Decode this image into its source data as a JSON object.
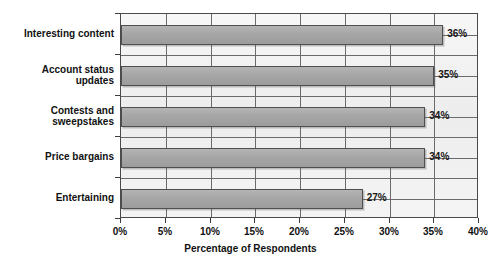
{
  "chart_data": {
    "type": "bar",
    "orientation": "horizontal",
    "title": "",
    "xlabel": "Percentage of Respondents",
    "ylabel": "",
    "categories": [
      "Interesting content",
      "Account status\nupdates",
      "Contests and\nsweepstakes",
      "Price bargains",
      "Entertaining"
    ],
    "values": [
      36,
      35,
      34,
      34,
      27
    ],
    "value_labels": [
      "36%",
      "35%",
      "34%",
      "34%",
      "27%"
    ],
    "xlim": [
      0,
      40
    ],
    "xticks": [
      0,
      5,
      10,
      15,
      20,
      25,
      30,
      35,
      40
    ],
    "xtick_labels": [
      "0%",
      "5%",
      "10%",
      "15%",
      "20%",
      "25%",
      "30%",
      "35%",
      "40%"
    ],
    "grid": true,
    "grid_axis": "both",
    "legend": null,
    "colors": {
      "bar_fill": "#a6a6a6",
      "bar_edge": "#4f4f4f",
      "plot_background": "#f2f2f2",
      "frame": "#4a4a4a",
      "gridline": "#6b6b6b",
      "text": "#111111"
    }
  },
  "axis": {
    "x_title": "Percentage of Respondents"
  }
}
